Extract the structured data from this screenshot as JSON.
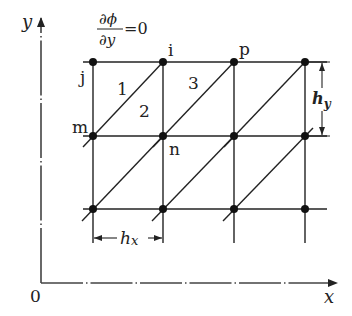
{
  "diagram": {
    "type": "finite-element-grid",
    "colors": {
      "line": "#222222",
      "node": "#111111",
      "axis": "#444444",
      "background": "#ffffff"
    },
    "axes": {
      "x_label": "x",
      "y_label": "y",
      "origin_label": "0"
    },
    "boundary_condition": {
      "numerator": "∂ϕ",
      "denominator": "∂y",
      "equals": "=0"
    },
    "grid": {
      "columns_x": [
        93,
        163,
        234,
        305
      ],
      "rows_y": [
        62,
        136,
        209
      ]
    },
    "node_labels": [
      {
        "name": "j",
        "text": "j"
      },
      {
        "name": "i",
        "text": "i"
      },
      {
        "name": "p",
        "text": "p"
      },
      {
        "name": "m",
        "text": "m"
      },
      {
        "name": "n",
        "text": "n"
      }
    ],
    "element_labels": [
      {
        "name": "element-1",
        "text": "1"
      },
      {
        "name": "element-2",
        "text": "2"
      },
      {
        "name": "element-3",
        "text": "3"
      }
    ],
    "dimensions": {
      "hx": {
        "base": "h",
        "sub": "x"
      },
      "hy": {
        "base": "h",
        "sub": "y"
      }
    }
  }
}
